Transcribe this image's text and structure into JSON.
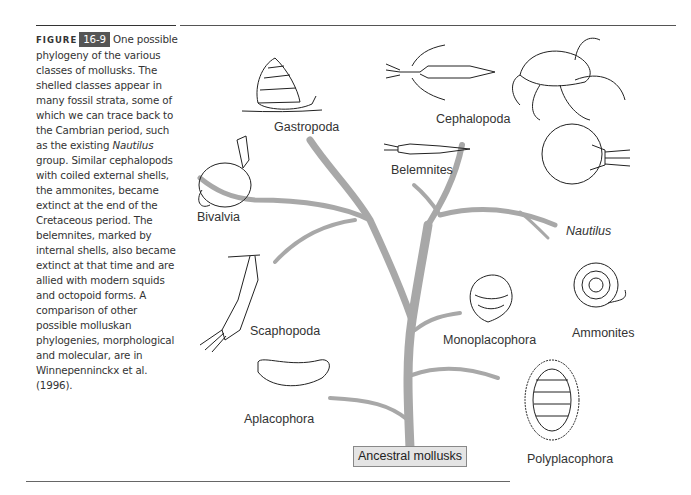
{
  "caption": {
    "figure_label": "FIGURE",
    "figure_number": "16-9",
    "text_part1": " One possible phylogeny of the various classes of mollusks. The shelled classes appear in many fossil strata, some of which we can trace back to the Cambrian period, such as the existing ",
    "text_italic": "Nautilus",
    "text_part2": " group. Similar cephalopods with coiled external shells, the ammonites, became extinct at the end of the Cretaceous period. The belemnites, marked by internal shells, also became extinct at that time and are allied with modern squids and octopoid forms. A comparison of other possible molluskan phylogenies, morphological and molecular, are in Winnepenninckx et al. (1996)."
  },
  "tree": {
    "root_label": "Ancestral mollusks",
    "branch_color": "#a8a8a8",
    "taxa": [
      {
        "name": "Gastropoda",
        "italic": false
      },
      {
        "name": "Cephalopoda",
        "italic": false
      },
      {
        "name": "Belemnites",
        "italic": false
      },
      {
        "name": "Bivalvia",
        "italic": false
      },
      {
        "name": "Nautilus",
        "italic": true
      },
      {
        "name": "Scaphopoda",
        "italic": false
      },
      {
        "name": "Ammonites",
        "italic": false
      },
      {
        "name": "Monoplacophora",
        "italic": false
      },
      {
        "name": "Aplacophora",
        "italic": false
      },
      {
        "name": "Polyplacophora",
        "italic": false
      }
    ]
  }
}
